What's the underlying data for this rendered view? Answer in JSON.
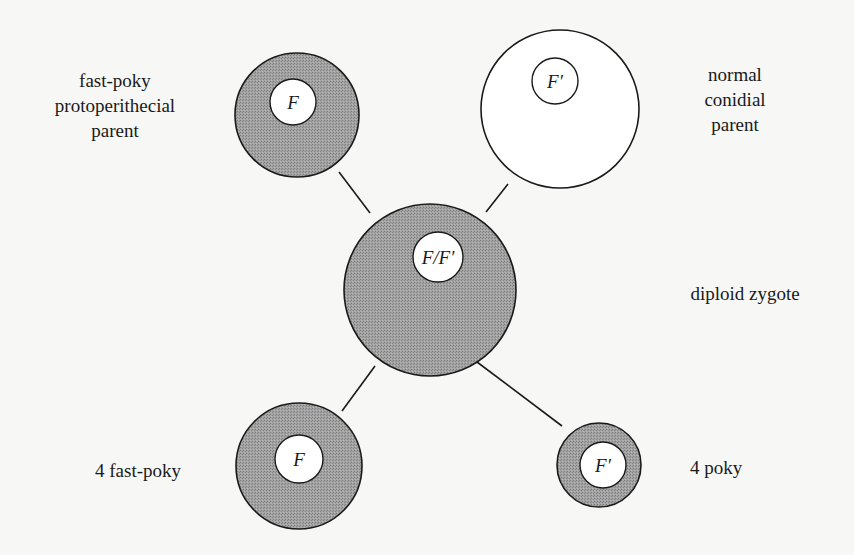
{
  "diagram": {
    "type": "genetic-cross",
    "colors": {
      "background": "#f7f7f5",
      "shaded_cytoplasm": "#9a9a9a",
      "outline": "#1a1a1a",
      "nucleus_fill": "#ffffff"
    },
    "nodes": [
      {
        "id": "fast-poky-parent",
        "label_lines": [
          "fast-poky",
          "protoperithecial",
          "parent"
        ],
        "nucleus": "F",
        "shaded": true
      },
      {
        "id": "normal-parent",
        "label_lines": [
          "normal",
          "conidial",
          "parent"
        ],
        "nucleus": "F′",
        "shaded": false
      },
      {
        "id": "diploid-zygote",
        "label_lines": [
          "diploid zygote"
        ],
        "nucleus": "F/F′",
        "shaded": true
      },
      {
        "id": "fast-poky-progeny",
        "label_lines": [
          "4 fast-poky"
        ],
        "nucleus": "F",
        "shaded": true
      },
      {
        "id": "poky-progeny",
        "label_lines": [
          "4 poky"
        ],
        "nucleus": "F′",
        "shaded": true
      }
    ],
    "edges": [
      {
        "from": "fast-poky-parent",
        "to": "diploid-zygote"
      },
      {
        "from": "normal-parent",
        "to": "diploid-zygote"
      },
      {
        "from": "diploid-zygote",
        "to": "fast-poky-progeny"
      },
      {
        "from": "diploid-zygote",
        "to": "poky-progeny"
      }
    ]
  }
}
